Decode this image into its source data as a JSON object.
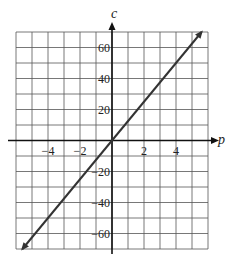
{
  "chart_data": {
    "type": "line",
    "title": "",
    "xlabel": "p",
    "ylabel": "c",
    "xlim": [
      -6,
      6
    ],
    "ylim": [
      -70,
      70
    ],
    "grid": true,
    "x_grid_step": 1,
    "y_grid_step": 10,
    "x_tick_labels": [
      "-4",
      "-2",
      "2",
      "4"
    ],
    "x_ticks": [
      -4,
      -2,
      2,
      4
    ],
    "y_tick_labels": [
      "60",
      "40",
      "20",
      "-20",
      "-40",
      "-60"
    ],
    "y_ticks": [
      60,
      40,
      20,
      -20,
      -40,
      -60
    ],
    "series": [
      {
        "name": "c = 12.5p",
        "x": [
          -5.6,
          0,
          2,
          4,
          5.6
        ],
        "y": [
          -70,
          0,
          25,
          50,
          70
        ],
        "arrows": "both"
      }
    ],
    "colors": {
      "line": "#333333",
      "grid": "#555555",
      "axis": "#111111"
    }
  }
}
